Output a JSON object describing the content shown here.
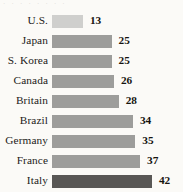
{
  "top_partial_text": "· · · · · · · ·",
  "chart_data": {
    "type": "bar",
    "orientation": "horizontal",
    "title": "",
    "subtitle": "",
    "xlabel": "",
    "ylabel": "",
    "grid": false,
    "legend": false,
    "xlim": [
      0,
      45
    ],
    "categories": [
      "U.S.",
      "Japan",
      "S. Korea",
      "Canada",
      "Britain",
      "Brazil",
      "Germany",
      "France",
      "Italy"
    ],
    "values": [
      13,
      25,
      25,
      26,
      28,
      34,
      35,
      37,
      42
    ],
    "value_labels": [
      "13",
      "25",
      "25",
      "26",
      "28",
      "34",
      "35",
      "37",
      "42"
    ],
    "bar_colors": [
      "#cfcfcd",
      "#9d9d9b",
      "#9d9d9b",
      "#9d9d9b",
      "#9d9d9b",
      "#9d9d9b",
      "#9d9d9b",
      "#9d9d9b",
      "#595755"
    ],
    "bar_shades": [
      "light",
      "mid",
      "mid",
      "mid",
      "mid",
      "mid",
      "mid",
      "mid",
      "dark"
    ],
    "background_color": "#fbfaf7",
    "label_color": "#1d1b19",
    "value_color": "#16140f"
  }
}
